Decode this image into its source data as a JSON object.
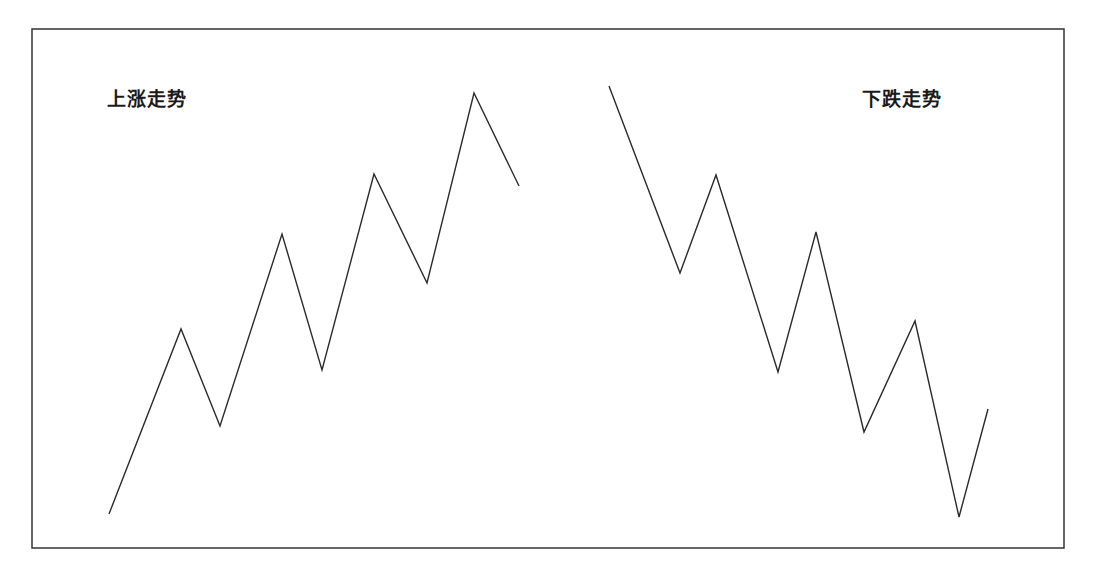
{
  "chart_data": {
    "type": "line",
    "title": "",
    "xlabel": "",
    "ylabel": "",
    "grid": false,
    "legend": "none",
    "axes_visible": false,
    "frame": {
      "x": 32,
      "y": 29,
      "width": 1032,
      "height": 519,
      "color": "#333333"
    },
    "line_color": "#2a2a2a",
    "series": [
      {
        "name": "上涨走势",
        "label_position": {
          "x": 107,
          "y": 90
        },
        "points": [
          [
            109,
            514
          ],
          [
            181,
            329
          ],
          [
            220,
            426
          ],
          [
            282,
            234
          ],
          [
            322,
            370
          ],
          [
            374,
            174
          ],
          [
            427,
            283
          ],
          [
            474,
            93
          ],
          [
            519,
            186
          ]
        ]
      },
      {
        "name": "下跌走势",
        "label_position": {
          "x": 862,
          "y": 90
        },
        "points": [
          [
            609,
            86
          ],
          [
            680,
            273
          ],
          [
            716,
            175
          ],
          [
            778,
            372
          ],
          [
            816,
            232
          ],
          [
            864,
            432
          ],
          [
            915,
            321
          ],
          [
            959,
            517
          ],
          [
            988,
            409
          ]
        ]
      }
    ]
  },
  "labels": {
    "uptrend": "上涨走势",
    "downtrend": "下跌走势"
  }
}
